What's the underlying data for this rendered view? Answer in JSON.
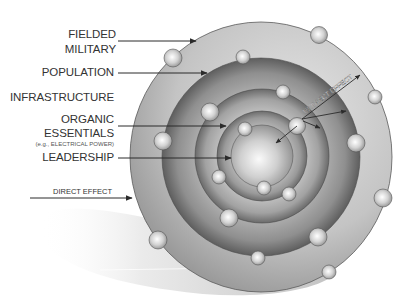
{
  "diagram": {
    "type": "five-ring concentric model",
    "rings": [
      {
        "id": "fielded-military",
        "label_lines": [
          "FIELDED",
          "MILITARY"
        ],
        "order": 5
      },
      {
        "id": "population",
        "label_lines": [
          "POPULATION"
        ],
        "order": 4
      },
      {
        "id": "infrastructure",
        "label_lines": [
          "INFRASTRUCTURE"
        ],
        "order": 3
      },
      {
        "id": "organic-essentials",
        "label_lines": [
          "ORGANIC",
          "ESSENTIALS"
        ],
        "sub_label": "(e.g., ELECTRICAL POWER)",
        "order": 2
      },
      {
        "id": "leadership",
        "label_lines": [
          "LEADERSHIP"
        ],
        "order": 1
      }
    ],
    "labels": {
      "fielded_1": "FIELDED",
      "fielded_2": "MILITARY",
      "population": "POPULATION",
      "infrastructure": "INFRASTRUCTURE",
      "organic_1": "ORGANIC",
      "organic_2": "ESSENTIALS",
      "organic_sub": "(e.g., ELECTRICAL POWER)",
      "leadership": "LEADERSHIP",
      "direct_effect": "DIRECT EFFECT",
      "indirect_effect": "INDIRECT EFFECT"
    },
    "colors": {
      "background": "#ffffff",
      "outer_ring": "#b9b9b9",
      "population_ring": "#8a8a8a",
      "infrastructure_ring": "#a0a0a0",
      "organic_ring": "#909090",
      "core": "#d8d8d8",
      "arrow": "#333333",
      "text": "#333333"
    },
    "node_count": 19
  }
}
